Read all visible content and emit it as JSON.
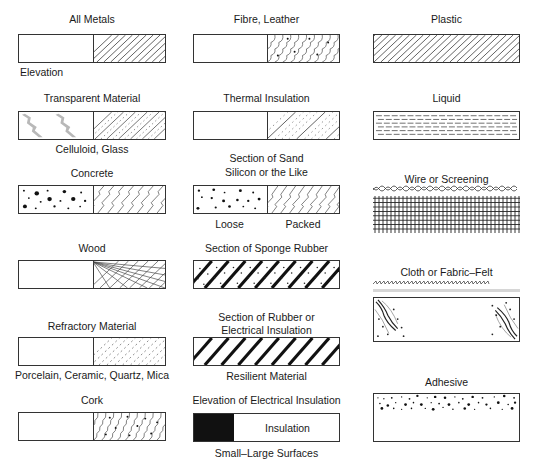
{
  "columns": [
    {
      "items": [
        {
          "title": "All Metals",
          "caption": "Elevation",
          "pattern": "metal-hatch"
        },
        {
          "title": "Transparent Material",
          "caption": "Celluloid, Glass",
          "pattern": "transparent"
        },
        {
          "title": "Concrete",
          "caption": "",
          "pattern": "concrete"
        },
        {
          "title": "Wood",
          "caption": "",
          "pattern": "wood-grain"
        },
        {
          "title": "Refractory Material",
          "caption": "Porcelain, Ceramic, Quartz, Mica",
          "pattern": "refractory"
        },
        {
          "title": "Cork",
          "caption": "",
          "pattern": "cork"
        }
      ]
    },
    {
      "items": [
        {
          "title": "Fibre, Leather",
          "caption": "",
          "pattern": "fibre"
        },
        {
          "title": "Thermal Insulation",
          "caption": "",
          "pattern": "thermal"
        },
        {
          "title_line1": "Section of Sand",
          "title_line2": "Silicon or the Like",
          "caption_left": "Loose",
          "caption_right": "Packed",
          "pattern": "sand"
        },
        {
          "title": "Section of Sponge Rubber",
          "caption": "",
          "pattern": "sponge-rubber"
        },
        {
          "title_line1": "Section of Rubber or",
          "title_line2": "Electrical Insulation",
          "caption": "Resilient Material",
          "pattern": "rubber"
        },
        {
          "title": "Elevation of Electrical Insulation",
          "inner_label": "Insulation",
          "caption": "Small–Large Surfaces",
          "pattern": "electrical-insulation"
        }
      ]
    },
    {
      "items": [
        {
          "title": "Plastic",
          "caption": "",
          "pattern": "plastic-hatch"
        },
        {
          "title": "Liquid",
          "caption": "",
          "pattern": "liquid-dashes"
        },
        {
          "title": "Wire or Screening",
          "caption": "",
          "pattern": "wire-grid"
        },
        {
          "title": "Cloth or Fabric–Felt",
          "caption": "",
          "pattern": "cloth-felt"
        },
        {
          "title": "Adhesive",
          "caption": "",
          "pattern": "adhesive-dots"
        }
      ]
    }
  ],
  "colors": {
    "ink": "#1a1a1a",
    "line": "#333333",
    "light_gray": "#b0b0b0"
  }
}
